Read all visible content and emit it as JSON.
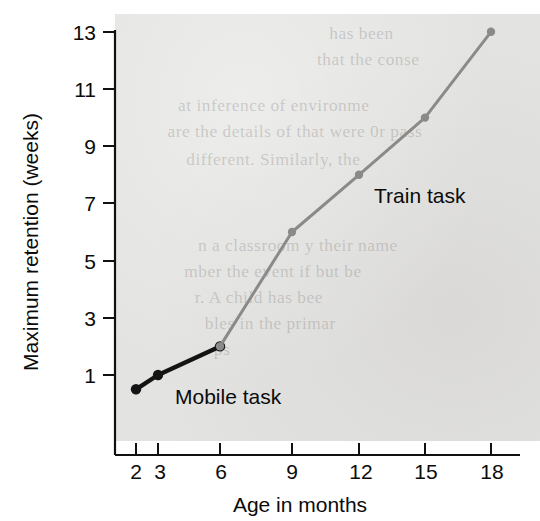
{
  "chart_data": {
    "type": "line",
    "title": "",
    "xlabel": "Age in months",
    "ylabel": "Maximum retention (weeks)",
    "x_tick_labels": [
      "2",
      "3",
      "6",
      "9",
      "12",
      "15",
      "18"
    ],
    "x_tick_values": [
      2,
      3,
      6,
      9,
      12,
      15,
      18
    ],
    "y_tick_labels": [
      "1",
      "3",
      "5",
      "7",
      "9",
      "11",
      "13"
    ],
    "y_tick_values": [
      1,
      3,
      5,
      7,
      9,
      11,
      13
    ],
    "ylim": [
      0,
      13
    ],
    "xlim": [
      2,
      18
    ],
    "grid": false,
    "legend_position": "inline-annotations",
    "series": [
      {
        "name": "Mobile task",
        "color": "#141414",
        "x": [
          2,
          3,
          6
        ],
        "values": [
          0.5,
          1.0,
          2.0
        ],
        "annotation": "Mobile task"
      },
      {
        "name": "Train task",
        "color": "#8a8a8a",
        "x": [
          6,
          9,
          12,
          15,
          18
        ],
        "values": [
          2.0,
          6.0,
          8.0,
          10.0,
          13.0
        ],
        "annotation": "Train task"
      }
    ],
    "annotations": [
      {
        "text": "Mobile task",
        "x": 4.0,
        "y": 0.95
      },
      {
        "text": "Train task",
        "x": 12.6,
        "y": 7.6
      }
    ]
  },
  "background": {
    "plot_fill": "#e3e3e1",
    "page_fill": "#ffffff",
    "ghost_lines": [
      "has been",
      "that the conse",
      "at inference   of environme",
      "are the details of that were 0r pass",
      "different. Similarly, the",
      "n a classroom   y their name",
      "mber the event if   but be",
      "r. A child has bee",
      "bles in the primar",
      "ps"
    ]
  }
}
